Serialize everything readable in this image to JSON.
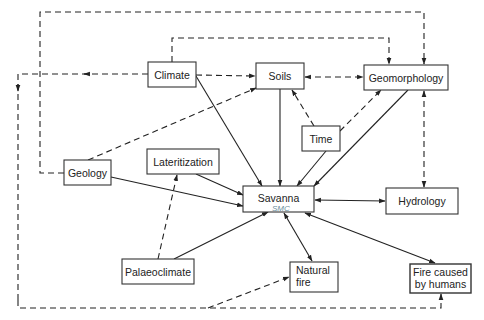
{
  "diagram": {
    "type": "flow-diagram",
    "title": "",
    "nodes": [
      {
        "id": "climate",
        "label": "Climate",
        "lines": [
          "Climate"
        ]
      },
      {
        "id": "soils",
        "label": "Soils",
        "lines": [
          "Soils"
        ]
      },
      {
        "id": "geomorphology",
        "label": "Geomorphology",
        "lines": [
          "Geomorphology"
        ]
      },
      {
        "id": "time",
        "label": "Time",
        "lines": [
          "Time"
        ]
      },
      {
        "id": "lateritization",
        "label": "Lateritization",
        "lines": [
          "Lateritization"
        ]
      },
      {
        "id": "geology",
        "label": "Geology",
        "lines": [
          "Geology"
        ]
      },
      {
        "id": "savanna",
        "label": "Savanna",
        "lines": [
          "Savanna"
        ]
      },
      {
        "id": "hydrology",
        "label": "Hydrology",
        "lines": [
          "Hydrology"
        ]
      },
      {
        "id": "palaeoclimate",
        "label": "Palaeoclimate",
        "lines": [
          "Palaeoclimate"
        ]
      },
      {
        "id": "natural_fire",
        "label": "Natural fire",
        "lines": [
          "Natural",
          "fire"
        ]
      },
      {
        "id": "fire_humans",
        "label": "Fire caused by humans",
        "lines": [
          "Fire caused",
          "by humans"
        ]
      }
    ],
    "edges": [
      {
        "from": "climate",
        "to": "savanna",
        "style": "solid",
        "direction": "forward"
      },
      {
        "from": "climate",
        "to": "soils",
        "style": "dashed",
        "direction": "forward"
      },
      {
        "from": "climate",
        "to": "geomorphology",
        "style": "dashed",
        "direction": "forward"
      },
      {
        "from": "climate",
        "to": "fire_humans",
        "style": "dashed",
        "direction": "forward",
        "route": "left-border-bottom"
      },
      {
        "from": "geology",
        "to": "geomorphology",
        "style": "dashed",
        "direction": "forward",
        "route": "top-border"
      },
      {
        "from": "geology",
        "to": "soils",
        "style": "dashed",
        "direction": "forward"
      },
      {
        "from": "geology",
        "to": "savanna",
        "style": "solid",
        "direction": "forward"
      },
      {
        "from": "soils",
        "to": "geomorphology",
        "style": "dashed",
        "direction": "both"
      },
      {
        "from": "soils",
        "to": "savanna",
        "style": "solid",
        "direction": "forward"
      },
      {
        "from": "time",
        "to": "soils",
        "style": "dashed",
        "direction": "forward"
      },
      {
        "from": "time",
        "to": "geomorphology",
        "style": "dashed",
        "direction": "forward"
      },
      {
        "from": "time",
        "to": "savanna",
        "style": "solid",
        "direction": "forward"
      },
      {
        "from": "geomorphology",
        "to": "savanna",
        "style": "solid",
        "direction": "forward"
      },
      {
        "from": "geomorphology",
        "to": "hydrology",
        "style": "dashed",
        "direction": "both"
      },
      {
        "from": "lateritization",
        "to": "savanna",
        "style": "solid",
        "direction": "forward"
      },
      {
        "from": "palaeoclimate",
        "to": "lateritization",
        "style": "dashed",
        "direction": "forward"
      },
      {
        "from": "palaeoclimate",
        "to": "savanna",
        "style": "solid",
        "direction": "forward"
      },
      {
        "from": "savanna",
        "to": "hydrology",
        "style": "solid",
        "direction": "both"
      },
      {
        "from": "savanna",
        "to": "natural_fire",
        "style": "solid",
        "direction": "both"
      },
      {
        "from": "savanna",
        "to": "fire_humans",
        "style": "solid",
        "direction": "both"
      },
      {
        "from": "climate",
        "to": "natural_fire",
        "style": "dashed",
        "direction": "forward",
        "route": "via-bottom-line"
      }
    ],
    "annotations": [
      {
        "text": "SMC",
        "note": "handwritten pencil mark under Savanna"
      }
    ]
  }
}
